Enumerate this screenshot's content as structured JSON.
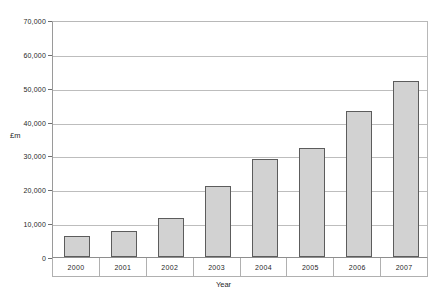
{
  "chart_data": {
    "type": "bar",
    "title": "",
    "xlabel": "Year",
    "ylabel": "£m",
    "categories": [
      "2000",
      "2001",
      "2002",
      "2003",
      "2004",
      "2005",
      "2006",
      "2007"
    ],
    "values": [
      6200,
      7700,
      11400,
      21000,
      29000,
      32200,
      43000,
      52000
    ],
    "ylim": [
      0,
      70000
    ],
    "ytick_values": [
      0,
      10000,
      20000,
      30000,
      40000,
      50000,
      60000,
      70000
    ],
    "ytick_labels": [
      "0",
      "10,000",
      "20,000",
      "30,000",
      "40,000",
      "50,000",
      "60,000",
      "70,000"
    ],
    "grid": true,
    "legend": null,
    "series": [
      {
        "name": "",
        "values": [
          6200,
          7700,
          11400,
          21000,
          29000,
          32200,
          43000,
          52000
        ]
      }
    ],
    "colors": {
      "bar_fill": "#d2d2d2",
      "bar_border": "#5c5c5c",
      "gridline": "#bdbdbd",
      "axis": "#8e8e8e",
      "background": "#ffffff",
      "text": "#1f1f1f"
    }
  }
}
